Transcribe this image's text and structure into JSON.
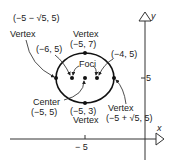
{
  "diagram": {
    "type": "ellipse-graph",
    "axes": {
      "x_label": "x",
      "y_label": "y",
      "x_tick": "− 5",
      "y_tick": "5"
    },
    "ellipse": {
      "center": {
        "label": "Center",
        "coords": "(−5, 5)"
      },
      "vertices": [
        {
          "label": "Vertex",
          "coords": "(−5 − √5, 5)",
          "position": "left"
        },
        {
          "label": "Vertex",
          "coords": "(−5, 7)",
          "position": "top"
        },
        {
          "label": "Vertex",
          "coords": "(−5 + √5, 5)",
          "position": "right"
        },
        {
          "label": "Vertex",
          "coords": "(−5, 3)",
          "position": "bottom"
        }
      ],
      "foci": {
        "label": "Foci",
        "points": [
          "(−6, 5)",
          "(−4, 5)"
        ]
      }
    }
  }
}
